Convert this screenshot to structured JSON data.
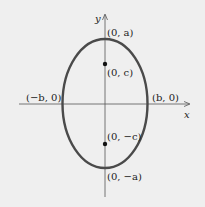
{
  "diagram": {
    "axes": {
      "x_label": "x",
      "y_label": "y"
    },
    "ellipse": {
      "cx": 105,
      "cy": 103.5,
      "rx": 42.5,
      "ry": 64.5,
      "stroke": "#4a4a4a"
    },
    "points": [
      {
        "id": "vertex-top",
        "label": "(0, a)",
        "x": 105,
        "y": 39,
        "marker": false
      },
      {
        "id": "focus-top",
        "label": "(0, c)",
        "x": 105,
        "y": 64,
        "marker": true
      },
      {
        "id": "covertex-left",
        "label": "(−b, 0)",
        "x": 62,
        "y": 104,
        "marker": false
      },
      {
        "id": "covertex-right",
        "label": "(b, 0)",
        "x": 147,
        "y": 104,
        "marker": false
      },
      {
        "id": "focus-bottom",
        "label": "(0, −c)",
        "x": 105,
        "y": 144,
        "marker": true
      },
      {
        "id": "vertex-bottom",
        "label": "(0, −a)",
        "x": 105,
        "y": 168,
        "marker": false
      }
    ],
    "background": "#efefef"
  }
}
